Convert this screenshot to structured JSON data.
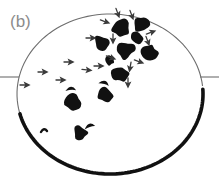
{
  "figure": {
    "panel_label": "(b)",
    "label_position": {
      "x": 10,
      "y": 27
    },
    "width": 219,
    "height": 187,
    "background_color": "#ffffff"
  },
  "colors": {
    "outline_thin": "#6e6e6e",
    "outline_thick": "#111111",
    "blob_fill": "#111111",
    "arrow_stroke": "#3a3a3a",
    "axis_line": "#6e6e6e",
    "label_color": "#8c8c8c"
  },
  "boundary": {
    "name": "ellipse-outline",
    "center": {
      "cx": 110,
      "cy": 94
    },
    "radii": {
      "rx": 93,
      "ry": 80
    },
    "thin_stroke_width": 1.1,
    "thick_stroke_width": 3.6,
    "thin_arc_description": "thin gray arc from right equator counter-clockwise over the top to lower-left",
    "thick_arc_description": "thick black arc along the bottom-right from right equator to lower-left"
  },
  "equator_lines": [
    {
      "name": "equator-line-left",
      "x1": 0,
      "y1": 77,
      "x2": 19,
      "y2": 77
    },
    {
      "name": "equator-line-right",
      "x1": 200,
      "y1": 77,
      "x2": 219,
      "y2": 77
    }
  ],
  "boundary_tick": {
    "name": "boundary-tick-mark",
    "x": 41,
    "y": 132,
    "description": "small nub projecting inward from the thick lower-left arc"
  },
  "blobs": [
    {
      "id": "blob-01",
      "cx": 121,
      "cy": 28,
      "r": 9.2,
      "seed": 3
    },
    {
      "id": "blob-02",
      "cx": 141,
      "cy": 25,
      "r": 8.4,
      "seed": 11
    },
    {
      "id": "blob-03",
      "cx": 101,
      "cy": 43,
      "r": 8.0,
      "seed": 5
    },
    {
      "id": "blob-04",
      "cx": 125,
      "cy": 50,
      "r": 9.6,
      "seed": 17
    },
    {
      "id": "blob-05",
      "cx": 149,
      "cy": 52,
      "r": 8.8,
      "seed": 23
    },
    {
      "id": "blob-06",
      "cx": 120,
      "cy": 73,
      "r": 8.6,
      "seed": 29
    },
    {
      "id": "blob-07",
      "cx": 106,
      "cy": 96,
      "r": 8.4,
      "seed": 31
    },
    {
      "id": "blob-08",
      "cx": 73,
      "cy": 102,
      "r": 8.2,
      "seed": 37
    },
    {
      "id": "blob-09",
      "cx": 80,
      "cy": 133,
      "r": 7.6,
      "seed": 41
    },
    {
      "id": "blob-10",
      "cx": 136,
      "cy": 38,
      "r": 6.4,
      "seed": 47
    },
    {
      "id": "blob-11",
      "cx": 110,
      "cy": 60,
      "r": 5.4,
      "seed": 53
    }
  ],
  "crescents": [
    {
      "id": "crescent-01",
      "cx": 71,
      "cy": 90,
      "r": 5.0,
      "rotation": -40
    },
    {
      "id": "crescent-02",
      "cx": 104,
      "cy": 84,
      "r": 5.0,
      "rotation": -20
    },
    {
      "id": "crescent-03",
      "cx": 90,
      "cy": 127,
      "r": 5.2,
      "rotation": -55
    }
  ],
  "arrows": {
    "description": "small open chevron arrowheads with short tails indicating flow direction",
    "left_field": [
      {
        "id": "arrow-l1",
        "x": 26,
        "y": 85,
        "angle": 180
      },
      {
        "id": "arrow-l2",
        "x": 44,
        "y": 72,
        "angle": 180
      },
      {
        "id": "arrow-l3",
        "x": 62,
        "y": 80,
        "angle": 180
      },
      {
        "id": "arrow-l4",
        "x": 70,
        "y": 62,
        "angle": 180
      },
      {
        "id": "arrow-l5",
        "x": 88,
        "y": 70,
        "angle": 185
      }
    ],
    "cluster_field": [
      {
        "id": "arrow-c1",
        "x": 92,
        "y": 38,
        "angle": 180
      },
      {
        "id": "arrow-c2",
        "x": 106,
        "y": 22,
        "angle": 200
      },
      {
        "id": "arrow-c3",
        "x": 113,
        "y": 40,
        "angle": 270
      },
      {
        "id": "arrow-c4",
        "x": 132,
        "y": 16,
        "angle": 250
      },
      {
        "id": "arrow-c5",
        "x": 152,
        "y": 32,
        "angle": 160
      },
      {
        "id": "arrow-c6",
        "x": 140,
        "y": 62,
        "angle": 200
      },
      {
        "id": "arrow-c7",
        "x": 112,
        "y": 58,
        "angle": 200
      },
      {
        "id": "arrow-c8",
        "x": 100,
        "y": 66,
        "angle": 180
      },
      {
        "id": "arrow-c9",
        "x": 130,
        "y": 68,
        "angle": 280
      },
      {
        "id": "arrow-c10",
        "x": 128,
        "y": 84,
        "angle": 270
      },
      {
        "id": "arrow-c11",
        "x": 148,
        "y": 42,
        "angle": 250
      },
      {
        "id": "arrow-c12",
        "x": 118,
        "y": 14,
        "angle": 250
      }
    ]
  }
}
